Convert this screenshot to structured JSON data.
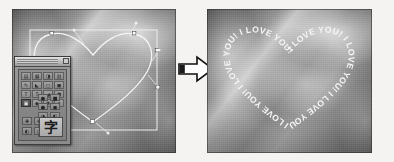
{
  "figure": {
    "background_color": "#f2f1ef",
    "panel_count": 2
  },
  "left_panel": {
    "name": "before-editing",
    "description": "Grayscale photograph with a heart-shaped bezier path selected, showing its bounding box, anchor points and direction handles",
    "photo": {
      "style": "grayscale diagonal light streaks",
      "base_color": "#8a8a8a"
    },
    "path": {
      "shape": "heart",
      "stroke_color": "#f2f2f2",
      "anchor_points": 5,
      "bounding_box_visible": true,
      "bounding_box_color": "#ededed"
    }
  },
  "tool_palette": {
    "name": "tool-palette",
    "title": "",
    "close_button_label": "",
    "tool_rows": [
      {
        "cells": [
          {
            "glyph": "▤",
            "name": "marquee-tool",
            "selected": false
          },
          {
            "glyph": "▦",
            "name": "crop-tool",
            "selected": false
          },
          {
            "glyph": "◨",
            "name": "slice-tool",
            "selected": false
          },
          {
            "glyph": "▥",
            "name": "move-tool",
            "selected": false
          }
        ]
      },
      {
        "cells": [
          {
            "glyph": "✎",
            "name": "pencil-tool",
            "selected": false
          },
          {
            "glyph": "◣",
            "name": "gradient-tool",
            "selected": false
          },
          {
            "glyph": "◻",
            "name": "eraser-tool",
            "selected": false
          },
          {
            "glyph": "◼",
            "name": "fill-tool",
            "selected": false
          }
        ]
      },
      {
        "cells": [
          {
            "glyph": "T",
            "name": "horizontal-type-tool",
            "selected": false
          },
          {
            "glyph": "T",
            "name": "vertical-type-tool",
            "selected": false
          },
          {
            "glyph": "◢",
            "name": "shape-tool",
            "selected": false
          },
          {
            "glyph": "◥",
            "name": "line-tool",
            "selected": false
          }
        ]
      },
      {
        "cells": [
          {
            "glyph": "▣",
            "name": "path-selection-tool",
            "selected": true
          },
          {
            "glyph": "◆",
            "name": "direct-selection-tool",
            "selected": false
          },
          {
            "glyph": "✱",
            "name": "brush-tool",
            "selected": false
          },
          {
            "glyph": "✦",
            "name": "dodge-tool",
            "selected": false
          }
        ]
      }
    ],
    "mini_buttons_right": [
      [
        {
          "glyph": "●",
          "name": "ellipse-shape-button",
          "selected": false
        },
        {
          "glyph": "■",
          "name": "rectangle-shape-button",
          "selected": false
        }
      ],
      [
        {
          "glyph": "●",
          "name": "circle-shape-button",
          "selected": false
        },
        {
          "glyph": "◼",
          "name": "square-shape-button",
          "selected": false
        }
      ],
      [
        {
          "glyph": "◕",
          "name": "rounded-shape-button",
          "selected": false
        },
        {
          "glyph": "◧",
          "name": "polygon-shape-button",
          "selected": false
        }
      ],
      [
        {
          "glyph": "◟",
          "name": "curve-button",
          "selected": false
        },
        {
          "glyph": "╱",
          "name": "line-button",
          "selected": false
        }
      ],
      [
        {
          "glyph": "◕",
          "name": "custom-shape-button",
          "selected": false
        },
        {
          "glyph": "◤",
          "name": "corner-button",
          "selected": false
        }
      ]
    ],
    "color_swatches": [
      [
        {
          "glyph": "✚",
          "name": "foreground-color-swatch"
        },
        {
          "glyph": "✚",
          "name": "background-color-swatch"
        }
      ],
      [
        {
          "glyph": "◐",
          "name": "quick-mask-swatch"
        },
        {
          "glyph": "◑",
          "name": "standard-mode-swatch"
        }
      ]
    ],
    "text_tool": {
      "name": "text-tool-button",
      "glyph": "字"
    }
  },
  "arrow": {
    "name": "transform-arrow",
    "direction": "right",
    "fill": "#ffffff",
    "stroke": "#111111"
  },
  "right_panel": {
    "name": "after-editing",
    "description": "Same photograph with the heart path replaced by repeating text running along the path",
    "path_text": {
      "phrase": "I LOVE YOU!",
      "repeat_count": 7,
      "color": "#f5f5f5",
      "full_string": "I LOVE YOU! I LOVE YOU! I LOVE YOU! I LOVE YOU! I LOVE YOU! I LOVE YOU! I LOVE YOU!"
    }
  }
}
